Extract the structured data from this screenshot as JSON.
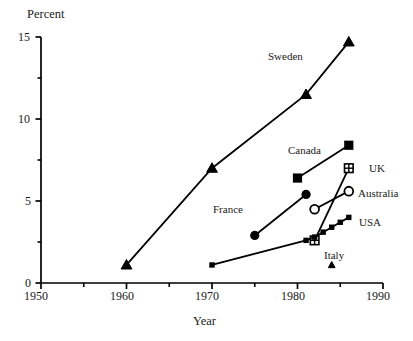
{
  "chart_data": {
    "type": "line",
    "title": "",
    "xlabel": "Year",
    "ylabel": "Percent",
    "xlim": [
      1950,
      1990
    ],
    "ylim": [
      0,
      15
    ],
    "grid": false,
    "legend_position": "inline-annotations",
    "xticks": [
      1950,
      1960,
      1970,
      1980,
      1990
    ],
    "xticks_minor": [
      1955,
      1965,
      1975,
      1985
    ],
    "yticks": [
      0,
      5,
      10,
      15
    ],
    "yticks_minor": [
      2.5,
      7.5,
      12.5
    ],
    "series": [
      {
        "name": "Sweden",
        "marker": "filled-triangle",
        "x": [
          1960,
          1970,
          1981,
          1986
        ],
        "values": [
          1.1,
          7.0,
          11.5,
          14.7
        ]
      },
      {
        "name": "Canada",
        "marker": "filled-square",
        "x": [
          1980,
          1986
        ],
        "values": [
          6.4,
          8.4
        ]
      },
      {
        "name": "UK",
        "marker": "crossed-square",
        "x": [
          1982,
          1986
        ],
        "values": [
          2.6,
          7.0
        ]
      },
      {
        "name": "Australia",
        "marker": "open-circle",
        "x": [
          1982,
          1986
        ],
        "values": [
          4.5,
          5.6
        ]
      },
      {
        "name": "France",
        "marker": "filled-circle",
        "x": [
          1975,
          1981
        ],
        "values": [
          2.9,
          5.4
        ]
      },
      {
        "name": "USA",
        "marker": "small-filled-square",
        "x": [
          1970,
          1981,
          1982,
          1983,
          1984,
          1985,
          1986
        ],
        "values": [
          1.1,
          2.6,
          2.8,
          3.1,
          3.4,
          3.7,
          4.0
        ]
      },
      {
        "name": "Italy",
        "marker": "small-filled-triangle",
        "x": [
          1984
        ],
        "values": [
          1.1
        ]
      }
    ]
  },
  "axes": {
    "y_axis_title": "Percent",
    "x_axis_title": "Year",
    "x_tick_labels": [
      "1950",
      "1960",
      "1970",
      "1980",
      "1990"
    ],
    "y_tick_labels": [
      "0",
      "5",
      "10",
      "15"
    ]
  },
  "annotations": {
    "sweden": "Sweden",
    "canada": "Canada",
    "uk": "UK",
    "australia": "Australia",
    "france": "France",
    "usa": "USA",
    "italy": "Italy"
  },
  "style": {
    "line_color": "#000000",
    "axis_color": "#000000",
    "background": "#ffffff"
  }
}
